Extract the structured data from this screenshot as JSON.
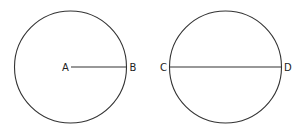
{
  "diagram": {
    "stroke_color": "#333333",
    "circles": [
      {
        "name": "left-circle",
        "cx": 70.5,
        "cy": 67,
        "r": 56,
        "segment": {
          "type": "radius",
          "x1": 71,
          "y1": 67,
          "x2": 126.5,
          "y2": 67
        },
        "labels": [
          {
            "text": "A",
            "x": 62,
            "y": 71
          },
          {
            "text": "B",
            "x": 129.5,
            "y": 71
          }
        ]
      },
      {
        "name": "right-circle",
        "cx": 225.5,
        "cy": 67,
        "r": 56,
        "segment": {
          "type": "diameter",
          "x1": 169.5,
          "y1": 67,
          "x2": 281.5,
          "y2": 67
        },
        "labels": [
          {
            "text": "C",
            "x": 160,
            "y": 71
          },
          {
            "text": "D",
            "x": 284,
            "y": 71
          }
        ]
      }
    ]
  }
}
